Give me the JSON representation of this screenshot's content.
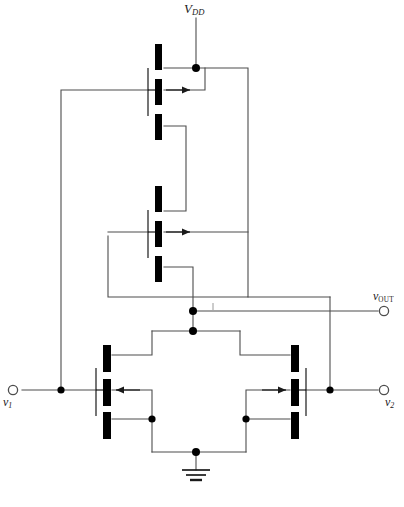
{
  "figure": {
    "kind": "circuit-schematic",
    "background_color": "#ffffff",
    "wire_color": "#4d4d4d",
    "device_color": "#000000",
    "label_color": "#1a1a1a"
  },
  "labels": {
    "supply": {
      "symbol": "V",
      "subscript": "DD",
      "text": "VDD"
    },
    "output": {
      "symbol": "v",
      "subscript": "OUT",
      "text": "vOUT"
    },
    "input_left": {
      "symbol": "v",
      "subscript": "1",
      "text": "v1"
    },
    "input_right": {
      "symbol": "v",
      "subscript": "2",
      "text": "v2"
    }
  },
  "terminals": [
    {
      "name": "vdd-terminal",
      "type": "supply-stub",
      "x": 196,
      "y": 18
    },
    {
      "name": "vout-terminal",
      "type": "open-circle",
      "x": 389,
      "y": 311
    },
    {
      "name": "v1-terminal",
      "type": "open-circle",
      "x": 12,
      "y": 390
    },
    {
      "name": "v2-terminal",
      "type": "open-circle",
      "x": 389,
      "y": 390
    },
    {
      "name": "ground-terminal",
      "type": "ground-symbol",
      "x": 196,
      "y": 470
    }
  ],
  "transistors": [
    {
      "name": "mosfet-top",
      "id": "M1",
      "type": "nmos",
      "orientation": "left-gate",
      "arrow": "right",
      "channel_x": 158,
      "gate_x": 148,
      "center_y": 90
    },
    {
      "name": "mosfet-middle",
      "id": "M2",
      "type": "nmos",
      "orientation": "left-gate",
      "arrow": "right",
      "channel_x": 158,
      "gate_x": 148,
      "center_y": 232
    },
    {
      "name": "mosfet-diffpair-left",
      "id": "M3",
      "type": "nmos",
      "orientation": "right-gate",
      "arrow": "left",
      "channel_x": 106,
      "gate_x": 96,
      "center_y": 390
    },
    {
      "name": "mosfet-diffpair-right",
      "id": "M4",
      "type": "nmos",
      "orientation": "left-gate",
      "arrow": "right",
      "channel_x": 296,
      "gate_x": 306,
      "center_y": 390
    }
  ],
  "junction_dots": [
    {
      "name": "junction-vdd-rail",
      "x": 196,
      "y": 68
    },
    {
      "name": "junction-vout-node",
      "x": 193,
      "y": 311
    },
    {
      "name": "junction-diffpair-drain",
      "x": 193,
      "y": 331
    },
    {
      "name": "junction-v1-node",
      "x": 61,
      "y": 390
    },
    {
      "name": "junction-v2-node",
      "x": 330,
      "y": 390
    },
    {
      "name": "junction-source-left",
      "x": 152,
      "y": 419
    },
    {
      "name": "junction-source-right",
      "x": 246,
      "y": 419
    },
    {
      "name": "junction-tail",
      "x": 196,
      "y": 452
    }
  ]
}
